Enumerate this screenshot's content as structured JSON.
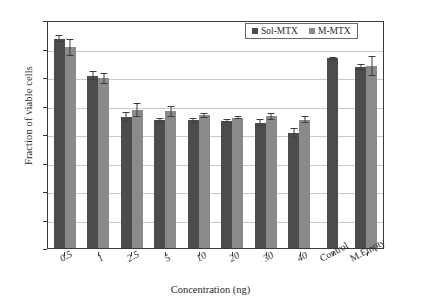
{
  "chart_data": {
    "type": "bar",
    "title": "",
    "xlabel": "Concentration (ng)",
    "ylabel": "Fraction of viable cells",
    "ylim": [
      0,
      1.6
    ],
    "ytick_labels": [
      "0",
      "0.2",
      "0.4",
      "0.6",
      "0.8",
      "1",
      "1.2",
      "1.4",
      "1.6"
    ],
    "ytick_values": [
      0,
      0.2,
      0.4,
      0.6,
      0.8,
      1.0,
      1.2,
      1.4,
      1.6
    ],
    "grid": true,
    "legend_position": "top-right",
    "categories": [
      "0.5",
      "1",
      "2.5",
      "5",
      "10",
      "20",
      "30",
      "40",
      "Control",
      "M.Empty"
    ],
    "series": [
      {
        "name": "Sol-MTX",
        "color": "#4c4c4c",
        "values": [
          1.47,
          1.21,
          0.92,
          0.9,
          0.895,
          0.89,
          0.88,
          0.81,
          1.33,
          1.27
        ],
        "errors": [
          0.025,
          0.03,
          0.035,
          0.015,
          0.015,
          0.015,
          0.025,
          0.035,
          0.008,
          0.02
        ]
      },
      {
        "name": "M-MTX",
        "color": "#8a8a8a",
        "values": [
          1.41,
          1.19,
          0.97,
          0.96,
          0.93,
          0.915,
          0.925,
          0.9,
          null,
          1.28
        ],
        "errors": [
          0.06,
          0.04,
          0.05,
          0.04,
          0.015,
          0.012,
          0.025,
          0.025,
          null,
          0.07
        ]
      }
    ]
  },
  "legend": {
    "entries": [
      {
        "label": "Sol-MTX"
      },
      {
        "label": "M-MTX"
      }
    ]
  }
}
